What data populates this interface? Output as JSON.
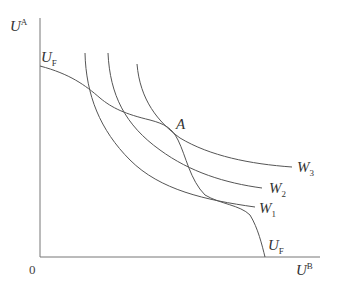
{
  "diagram": {
    "axes": {
      "y_label_main": "U",
      "y_label_sup": "A",
      "x_label_main": "U",
      "x_label_sup": "B",
      "origin": "0"
    },
    "frontier": {
      "top_label_main": "U",
      "top_label_sub": "F",
      "bottom_label_main": "U",
      "bottom_label_sub": "F"
    },
    "point": {
      "label": "A"
    },
    "welfare_curves": [
      {
        "main": "W",
        "sub": "1"
      },
      {
        "main": "W",
        "sub": "2"
      },
      {
        "main": "W",
        "sub": "3"
      }
    ],
    "colors": {
      "line": "#555555",
      "axis": "#777777",
      "text": "#333333"
    }
  }
}
